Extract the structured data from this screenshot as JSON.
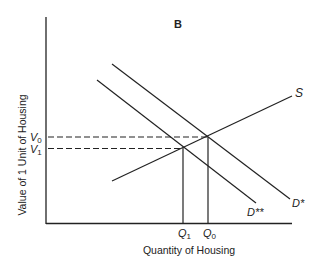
{
  "panel_label": "B",
  "y_axis_label": "Value of 1 Unit of Housing",
  "x_axis_label": "Quantity of Housing",
  "curves": {
    "supply": "S",
    "demand_original": "D*",
    "demand_shifted": "D**"
  },
  "y_ticks": {
    "v0": {
      "main": "V",
      "sub": "0"
    },
    "v1": {
      "main": "V",
      "sub": "1"
    }
  },
  "x_ticks": {
    "q1": {
      "main": "Q",
      "sub": "1"
    },
    "q0": {
      "main": "Q",
      "sub": "0"
    }
  },
  "colors": {
    "line": "#222222",
    "background": "#ffffff"
  }
}
